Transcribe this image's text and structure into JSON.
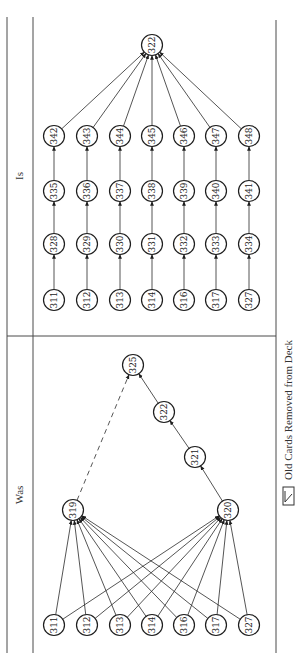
{
  "panels": {
    "is": {
      "title": "Is",
      "top_node": "322",
      "rows": [
        [
          "311",
          "312",
          "313",
          "314",
          "316",
          "317",
          "327"
        ],
        [
          "328",
          "329",
          "330",
          "331",
          "332",
          "333",
          "334"
        ],
        [
          "335",
          "336",
          "337",
          "338",
          "339",
          "340",
          "341"
        ],
        [
          "342",
          "343",
          "344",
          "345",
          "346",
          "347",
          "348"
        ]
      ]
    },
    "was": {
      "title": "Was",
      "base_nodes": [
        "311",
        "312",
        "313",
        "314",
        "316",
        "317",
        "327"
      ],
      "merge_left": "319",
      "merge_right": "320",
      "chain": [
        "321",
        "322",
        "325"
      ],
      "dashed_edge": {
        "from": "319",
        "to": "325"
      }
    }
  },
  "legend": {
    "icon": "old-card-icon",
    "label": "Old Cards Removed from Deck"
  },
  "colors": {
    "line": "#2a2a2a",
    "frame": "#4a4a4a",
    "background": "#ffffff"
  }
}
